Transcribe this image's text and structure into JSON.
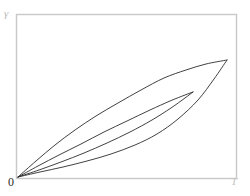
{
  "figure": {
    "background_color": "#ffffff",
    "frame_color": "#c8c8c8",
    "curve_color": "#2b2b2b"
  },
  "labels": {
    "y_axis": "γ",
    "origin": "0",
    "x_axis_end": "T"
  },
  "chart_data": {
    "type": "line",
    "title": "",
    "xlabel": "T",
    "ylabel": "γ",
    "xlim": [
      0,
      1
    ],
    "ylim": [
      0,
      1
    ],
    "grid": false,
    "legend": "none",
    "annotations": [
      "0",
      "γ",
      "T"
    ],
    "series": [
      {
        "name": "curve-1",
        "comment": "uppermost, least convex, reaches top endpoint",
        "x": [
          0.0,
          0.08,
          0.17,
          0.26,
          0.35,
          0.44,
          0.53,
          0.62,
          0.71,
          0.8,
          0.88,
          0.95
        ],
        "y": [
          0.0,
          0.1,
          0.2,
          0.29,
          0.38,
          0.46,
          0.55,
          0.63,
          0.71,
          0.79,
          0.86,
          0.92
        ],
        "path_points_px": [
          [
            18,
            177
          ],
          [
            36,
            161
          ],
          [
            55,
            145
          ],
          [
            75,
            130
          ],
          [
            96,
            116
          ],
          [
            118,
            103
          ],
          [
            141,
            90
          ],
          [
            164,
            78
          ],
          [
            186,
            70
          ],
          [
            206,
            64
          ],
          [
            227,
            60
          ]
        ]
      },
      {
        "name": "curve-2",
        "comment": "second, converges at interior point",
        "x": [
          0.0,
          0.09,
          0.18,
          0.28,
          0.38,
          0.48,
          0.58,
          0.68,
          0.76,
          0.82
        ],
        "y": [
          0.0,
          0.07,
          0.15,
          0.23,
          0.32,
          0.41,
          0.5,
          0.58,
          0.65,
          0.7
        ],
        "path_points_px": [
          [
            18,
            177
          ],
          [
            38,
            166
          ],
          [
            59,
            155
          ],
          [
            81,
            144
          ],
          [
            104,
            132
          ],
          [
            127,
            121
          ],
          [
            150,
            110
          ],
          [
            170,
            101
          ],
          [
            185,
            95
          ],
          [
            193,
            92
          ]
        ]
      },
      {
        "name": "curve-3",
        "comment": "third, more convex, converges at interior point",
        "x": [
          0.0,
          0.09,
          0.19,
          0.29,
          0.39,
          0.49,
          0.59,
          0.69,
          0.77,
          0.82
        ],
        "y": [
          0.0,
          0.05,
          0.11,
          0.18,
          0.25,
          0.33,
          0.42,
          0.53,
          0.63,
          0.7
        ],
        "path_points_px": [
          [
            18,
            177
          ],
          [
            39,
            170
          ],
          [
            61,
            162
          ],
          [
            84,
            153
          ],
          [
            107,
            143
          ],
          [
            130,
            132
          ],
          [
            152,
            120
          ],
          [
            171,
            108
          ],
          [
            185,
            98
          ],
          [
            193,
            92
          ]
        ]
      },
      {
        "name": "curve-4",
        "comment": "lowest, most convex, sweeps low then rises to top endpoint",
        "x": [
          0.0,
          0.1,
          0.2,
          0.31,
          0.41,
          0.52,
          0.62,
          0.72,
          0.81,
          0.89,
          0.95
        ],
        "y": [
          0.0,
          0.04,
          0.08,
          0.13,
          0.19,
          0.26,
          0.34,
          0.45,
          0.58,
          0.75,
          0.92
        ],
        "path_points_px": [
          [
            18,
            177
          ],
          [
            40,
            172
          ],
          [
            63,
            167
          ],
          [
            87,
            161
          ],
          [
            111,
            154
          ],
          [
            135,
            145
          ],
          [
            157,
            134
          ],
          [
            178,
            119
          ],
          [
            198,
            100
          ],
          [
            214,
            79
          ],
          [
            227,
            60
          ]
        ]
      }
    ]
  },
  "frame": {
    "left_px": 16,
    "top_px": 14,
    "right_px": 236,
    "bottom_px": 178
  }
}
